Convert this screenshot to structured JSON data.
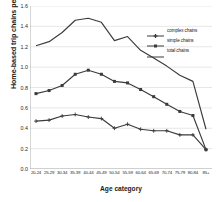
{
  "chart_data": {
    "type": "line",
    "title": "",
    "xlabel": "Age category",
    "ylabel": "Home-based trip chains per day",
    "ylim": [
      0.0,
      1.6
    ],
    "ytick_values": [
      0.0,
      0.2,
      0.4,
      0.6,
      0.8,
      1.0,
      1.2,
      1.4,
      1.6
    ],
    "ytick_labels": [
      "0.0",
      "0.2",
      "0.4",
      "0.6",
      "0.8",
      "1.0",
      "1.2",
      "1.4",
      "1.6"
    ],
    "grid": "horizontal",
    "legend_position": "upper-right",
    "categories": [
      "20-24",
      "25-29",
      "30-34",
      "35-39",
      "40-44",
      "45-49",
      "50-54",
      "55-59",
      "60-64",
      "65-69",
      "70-74",
      "75-79",
      "80-84",
      "85+"
    ],
    "series": [
      {
        "name": "complex chains",
        "marker": "plus",
        "values": [
          0.47,
          0.48,
          0.52,
          0.535,
          0.51,
          0.495,
          0.4,
          0.44,
          0.39,
          0.375,
          0.375,
          0.335,
          0.335,
          0.19
        ]
      },
      {
        "name": "simple chains",
        "marker": "square",
        "values": [
          0.74,
          0.77,
          0.82,
          0.93,
          0.97,
          0.93,
          0.86,
          0.845,
          0.78,
          0.71,
          0.635,
          0.565,
          0.525,
          0.19
        ]
      },
      {
        "name": "total chains",
        "marker": "none",
        "values": [
          1.21,
          1.25,
          1.34,
          1.46,
          1.48,
          1.44,
          1.26,
          1.3,
          1.165,
          1.09,
          1.01,
          0.92,
          0.86,
          0.39
        ]
      }
    ],
    "colors": {
      "line": "#3b3b3b",
      "grid": "#d6d6d6",
      "axis": "#9a9a9a",
      "background": "#ffffff"
    }
  },
  "legend": {
    "items": [
      {
        "label": "complex chains"
      },
      {
        "label": "simple chains"
      },
      {
        "label": "total chains"
      }
    ]
  }
}
